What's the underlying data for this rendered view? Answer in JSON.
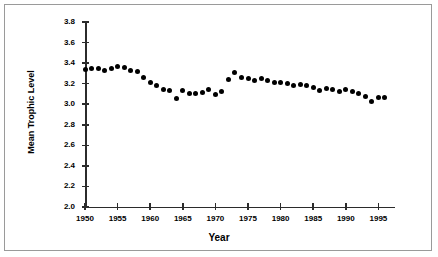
{
  "chart_data": {
    "type": "scatter",
    "title": "",
    "xlabel": "Year",
    "ylabel": "Mean Trophic Level",
    "xlim": [
      1948,
      1999
    ],
    "ylim": [
      2.0,
      3.8
    ],
    "grid": false,
    "legend": null,
    "xticks": [
      1950,
      1955,
      1960,
      1965,
      1970,
      1975,
      1980,
      1985,
      1990,
      1995
    ],
    "xtick_labels": [
      "1950",
      "1955",
      "1960",
      "1965",
      "1970",
      "1975",
      "1980",
      "1985",
      "1990",
      "1995"
    ],
    "yticks": [
      2.0,
      2.2,
      2.4,
      2.6,
      2.8,
      3.0,
      3.2,
      3.4,
      3.6,
      3.8
    ],
    "ytick_labels": [
      "2.0",
      "2.2",
      "2.4",
      "2.6",
      "2.8",
      "3.0",
      "3.2",
      "3.4",
      "3.6",
      "3.8"
    ],
    "marker": "filled-circle",
    "marker_color": "#000000",
    "x": [
      1950,
      1951,
      1952,
      1953,
      1954,
      1955,
      1956,
      1957,
      1958,
      1959,
      1960,
      1961,
      1962,
      1963,
      1964,
      1965,
      1966,
      1967,
      1968,
      1969,
      1970,
      1971,
      1972,
      1973,
      1974,
      1975,
      1976,
      1977,
      1978,
      1979,
      1980,
      1981,
      1982,
      1983,
      1984,
      1985,
      1986,
      1987,
      1988,
      1989,
      1990,
      1991,
      1992,
      1993,
      1994,
      1995,
      1996
    ],
    "values": [
      3.34,
      3.35,
      3.35,
      3.33,
      3.35,
      3.37,
      3.36,
      3.33,
      3.32,
      3.26,
      3.21,
      3.18,
      3.14,
      3.13,
      3.06,
      3.13,
      3.1,
      3.1,
      3.11,
      3.14,
      3.09,
      3.12,
      3.24,
      3.31,
      3.26,
      3.25,
      3.23,
      3.25,
      3.23,
      3.21,
      3.21,
      3.2,
      3.18,
      3.19,
      3.18,
      3.16,
      3.13,
      3.15,
      3.14,
      3.12,
      3.14,
      3.12,
      3.1,
      3.08,
      3.03,
      3.07,
      3.07
    ]
  },
  "axes": {
    "ylabel": "Mean Trophic Level",
    "xlabel": "Year"
  }
}
